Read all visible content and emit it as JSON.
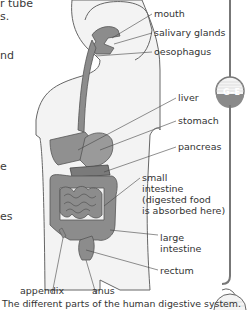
{
  "left_text_fragments": [
    {
      "id": "frag1",
      "text": "r tube",
      "x": 0,
      "y": -3
    },
    {
      "id": "frag2",
      "text": "s.",
      "x": 0,
      "y": 10
    },
    {
      "id": "frag3",
      "text": "nd",
      "x": 0,
      "y": 49
    },
    {
      "id": "frag4",
      "text": "e",
      "x": 0,
      "y": 160
    },
    {
      "id": "frag5",
      "text": "es",
      "x": 0,
      "y": 210
    }
  ],
  "labels": {
    "mouth": "mouth",
    "salivary_glands": "salivary glands",
    "oesophagus": "oesophagus",
    "liver": "liver",
    "stomach": "stomach",
    "pancreas": "pancreas",
    "small_intestine_1": "small",
    "small_intestine_2": "intestine",
    "small_intestine_3": "(digested food",
    "small_intestine_4": "is absorbed here)",
    "large_intestine_1": "large",
    "large_intestine_2": "intestine",
    "rectum": "rectum",
    "appendix": "appendix",
    "anus": "anus"
  },
  "caption": "The different parts of the human digestive system.",
  "grade_badge": "G–E",
  "colors": {
    "organ_fill": "#8c8c8c",
    "body_fill": "#f2f2f2",
    "outline": "#555555",
    "badge_bg": "#8a8a8a"
  }
}
